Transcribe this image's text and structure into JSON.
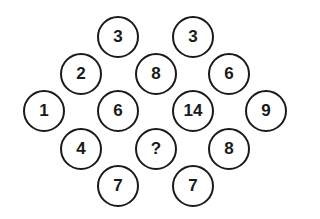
{
  "puzzle": {
    "colors": {
      "stroke": "#1a1a1a",
      "background": "#ffffff"
    },
    "circles": [
      {
        "label": "3",
        "x": 118,
        "y": 37
      },
      {
        "label": "3",
        "x": 193,
        "y": 37
      },
      {
        "label": "2",
        "x": 81,
        "y": 74
      },
      {
        "label": "8",
        "x": 156,
        "y": 74
      },
      {
        "label": "6",
        "x": 229,
        "y": 74
      },
      {
        "label": "1",
        "x": 44,
        "y": 111
      },
      {
        "label": "6",
        "x": 118,
        "y": 111
      },
      {
        "label": "14",
        "x": 193,
        "y": 111
      },
      {
        "label": "9",
        "x": 266,
        "y": 111
      },
      {
        "label": "4",
        "x": 81,
        "y": 149
      },
      {
        "label": "?",
        "x": 156,
        "y": 149
      },
      {
        "label": "8",
        "x": 229,
        "y": 149
      },
      {
        "label": "7",
        "x": 118,
        "y": 186
      },
      {
        "label": "7",
        "x": 193,
        "y": 186
      }
    ]
  }
}
